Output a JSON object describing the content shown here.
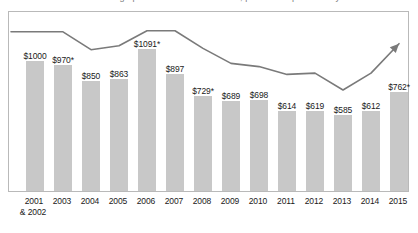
{
  "title_sliver": "average published tuition and fees, private nonprofit four-year institutions",
  "chart_data": {
    "type": "bar",
    "title": "",
    "subtitle": "",
    "xlabel": "",
    "ylabel": "",
    "grid": false,
    "legend": "none",
    "ylim": [
      0,
      1200
    ],
    "categories": [
      "2001 & 2002",
      "2003",
      "2004",
      "2005",
      "2006",
      "2007",
      "2008",
      "2009",
      "2010",
      "2011",
      "2012",
      "2013",
      "2014",
      "2015"
    ],
    "category_lines": [
      [
        "2001",
        "& 2002"
      ],
      [
        "2003"
      ],
      [
        "2004"
      ],
      [
        "2005"
      ],
      [
        "2006"
      ],
      [
        "2007"
      ],
      [
        "2008"
      ],
      [
        "2009"
      ],
      [
        "2010"
      ],
      [
        "2011"
      ],
      [
        "2012"
      ],
      [
        "2013"
      ],
      [
        "2014"
      ],
      [
        "2015"
      ]
    ],
    "values": [
      1000,
      970,
      850,
      863,
      1091,
      897,
      729,
      689,
      698,
      614,
      619,
      585,
      612,
      762
    ],
    "data_labels": [
      "$1000",
      "$970*",
      "$850",
      "$863",
      "$1091*",
      "$897",
      "$729*",
      "$689",
      "$698",
      "$614",
      "$619",
      "$585",
      "$612",
      "$762*"
    ],
    "series": [
      {
        "name": "trend line",
        "type": "line",
        "arrow_end": true,
        "values": [
          1148,
          1148,
          1010,
          1040,
          1155,
          1155,
          1020,
          905,
          880,
          820,
          830,
          700,
          830,
          1010
        ]
      }
    ],
    "bar_color": "#c8c8c8",
    "line_color": "#7a7a7a",
    "text_color": "#1a1a1a",
    "frame_color": "#b9b9b9"
  }
}
